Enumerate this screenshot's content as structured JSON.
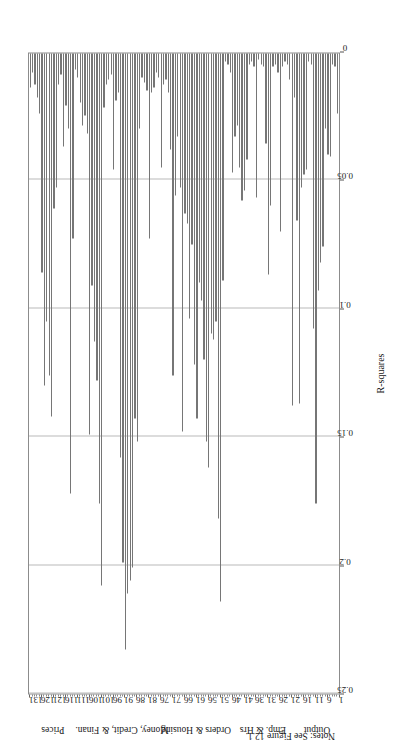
{
  "figure": {
    "note": "Notes: See Figure 12.1.",
    "bar_color": "#767676",
    "grid_color": "#b9b9b9",
    "axis_color": "#8c8c8c"
  },
  "chart_data": {
    "type": "bar",
    "orientation": "horizontal",
    "title": "",
    "subtitle": "",
    "xlabel": "",
    "ylabel": "R-squares",
    "value_axis_title": "R-squares",
    "value_axis_label": "R-squares",
    "grid": true,
    "legend": null,
    "legend_position": "none",
    "xlim": [
      1,
      131
    ],
    "ylim": [
      0,
      0.25
    ],
    "value_ticks": [
      0,
      0.05,
      0.1,
      0.15,
      0.2,
      0.25
    ],
    "value_tick_labels": [
      "0",
      "0.05",
      "0.1",
      "0.15",
      "0.2",
      "0.25"
    ],
    "category_ticks": [
      1,
      6,
      11,
      16,
      21,
      26,
      31,
      36,
      41,
      46,
      51,
      56,
      61,
      66,
      71,
      76,
      81,
      86,
      91,
      96,
      101,
      106,
      111,
      116,
      121,
      126,
      131
    ],
    "category_tick_labels": [
      "1",
      "6",
      "11",
      "16",
      "21",
      "26",
      "31",
      "36",
      "41",
      "46",
      "51",
      "56",
      "61",
      "66",
      "71",
      "76",
      "81",
      "86",
      "91",
      "96",
      "101",
      "106",
      "111",
      "116",
      "121",
      "126",
      "131"
    ],
    "groups": [
      {
        "label": "Output",
        "start": 1,
        "end": 20,
        "center": 10
      },
      {
        "label": "Emp. & Hrs",
        "start": 21,
        "end": 46,
        "center": 33
      },
      {
        "label": "Orders & Housing",
        "start": 47,
        "end": 76,
        "center": 61
      },
      {
        "label": "Money, Credit, & Finan.",
        "start": 77,
        "end": 110,
        "center": 92
      },
      {
        "label": "Prices",
        "start": 111,
        "end": 131,
        "center": 121
      }
    ],
    "categories": [
      1,
      2,
      3,
      4,
      5,
      6,
      7,
      8,
      9,
      10,
      11,
      12,
      13,
      14,
      15,
      16,
      17,
      18,
      19,
      20,
      21,
      22,
      23,
      24,
      25,
      26,
      27,
      28,
      29,
      30,
      31,
      32,
      33,
      34,
      35,
      36,
      37,
      38,
      39,
      40,
      41,
      42,
      43,
      44,
      45,
      46,
      47,
      48,
      49,
      50,
      51,
      52,
      53,
      54,
      55,
      56,
      57,
      58,
      59,
      60,
      61,
      62,
      63,
      64,
      65,
      66,
      67,
      68,
      69,
      70,
      71,
      72,
      73,
      74,
      75,
      76,
      77,
      78,
      79,
      80,
      81,
      82,
      83,
      84,
      85,
      86,
      87,
      88,
      89,
      90,
      91,
      92,
      93,
      94,
      95,
      96,
      97,
      98,
      99,
      100,
      101,
      102,
      103,
      104,
      105,
      106,
      107,
      108,
      109,
      110,
      111,
      112,
      113,
      114,
      115,
      116,
      117,
      118,
      119,
      120,
      121,
      122,
      123,
      124,
      125,
      126,
      127,
      128,
      129,
      130,
      131
    ],
    "values": [
      0.021,
      0.024,
      0.006,
      0.005,
      0.041,
      0.04,
      0.03,
      0.076,
      0.082,
      0.093,
      0.176,
      0.108,
      0.005,
      0.004,
      0.046,
      0.048,
      0.053,
      0.137,
      0.066,
      0.018,
      0.138,
      0.011,
      0.005,
      0.004,
      0.006,
      0.07,
      0.008,
      0.005,
      0.006,
      0.06,
      0.087,
      0.036,
      0.006,
      0.005,
      0.003,
      0.057,
      0.006,
      0.004,
      0.005,
      0.042,
      0.054,
      0.058,
      0.045,
      0.029,
      0.033,
      0.047,
      0.008,
      0.005,
      0.004,
      0.089,
      0.214,
      0.182,
      0.105,
      0.112,
      0.11,
      0.162,
      0.152,
      0.12,
      0.097,
      0.09,
      0.143,
      0.122,
      0.075,
      0.104,
      0.067,
      0.063,
      0.148,
      0.053,
      0.033,
      0.056,
      0.126,
      0.038,
      0.016,
      0.011,
      0.013,
      0.045,
      0.01,
      0.008,
      0.014,
      0.016,
      0.073,
      0.015,
      0.012,
      0.01,
      0.03,
      0.152,
      0.143,
      0.201,
      0.206,
      0.211,
      0.233,
      0.199,
      0.158,
      0.016,
      0.019,
      0.046,
      0.009,
      0.011,
      0.013,
      0.022,
      0.208,
      0.176,
      0.128,
      0.113,
      0.091,
      0.149,
      0.032,
      0.025,
      0.029,
      0.02,
      0.01,
      0.007,
      0.073,
      0.172,
      0.03,
      0.021,
      0.037,
      0.009,
      0.013,
      0.053,
      0.061,
      0.142,
      0.126,
      0.105,
      0.13,
      0.086,
      0.024,
      0.018,
      0.013,
      0.008,
      0.014
    ]
  }
}
